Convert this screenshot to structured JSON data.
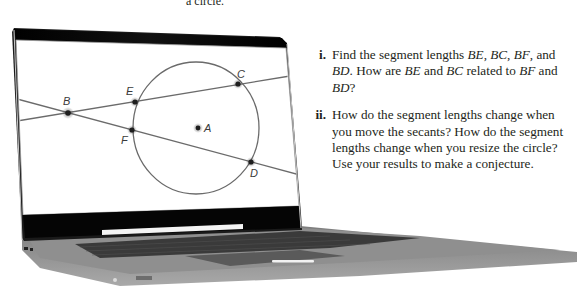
{
  "caption_partial": "a circle.",
  "questions": [
    {
      "number": "i.",
      "parts": [
        {
          "t": "Find the segment lengths "
        },
        {
          "t": "BE",
          "i": true
        },
        {
          "t": ", "
        },
        {
          "t": "BC",
          "i": true
        },
        {
          "t": ", "
        },
        {
          "t": "BF",
          "i": true
        },
        {
          "t": ", and "
        },
        {
          "t": "BD",
          "i": true
        },
        {
          "t": ". How are "
        },
        {
          "t": "BE",
          "i": true
        },
        {
          "t": " and "
        },
        {
          "t": "BC",
          "i": true
        },
        {
          "t": " related to "
        },
        {
          "t": "BF",
          "i": true
        },
        {
          "t": " and "
        },
        {
          "t": "BD",
          "i": true
        },
        {
          "t": "?"
        }
      ]
    },
    {
      "number": "ii.",
      "parts": [
        {
          "t": "How do the segment lengths change when you move the secants? How do the segment lengths change when you resize the circle? Use your results to make a conjecture."
        }
      ]
    }
  ],
  "figure": {
    "points": {
      "A": {
        "label": "A",
        "x": 198,
        "y": 128
      },
      "B": {
        "label": "B",
        "x": 68,
        "y": 113
      },
      "C": {
        "label": "C",
        "x": 238,
        "y": 84
      },
      "D": {
        "label": "D",
        "x": 251,
        "y": 162
      },
      "E": {
        "label": "E",
        "x": 135,
        "y": 102
      },
      "F": {
        "label": "F",
        "x": 132,
        "y": 130
      }
    },
    "circle": {
      "cx": 196,
      "cy": 128,
      "rx": 63,
      "ry": 66
    },
    "secants": [
      {
        "name": "BEC",
        "through": [
          "B",
          "E",
          "C"
        ]
      },
      {
        "name": "BFD",
        "through": [
          "B",
          "F",
          "D"
        ]
      }
    ],
    "colors": {
      "line": "#6b6b6b",
      "point": "#1e1e1e",
      "screen_bezel": "#0a0a0a",
      "laptop_body": "#8a8a8a"
    }
  }
}
